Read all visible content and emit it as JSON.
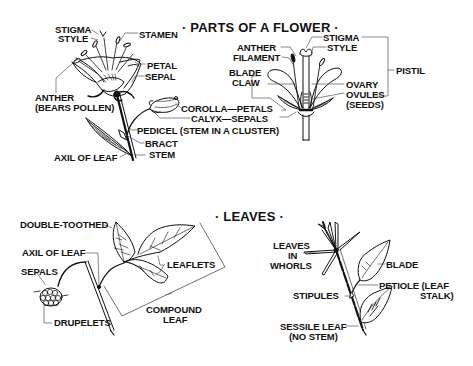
{
  "flower_section": {
    "title": "· PARTS OF A FLOWER ·",
    "left_flower_labels": {
      "stigma": "STIGMA",
      "style": "STYLE",
      "stamen": "STAMEN",
      "petal": "PETAL",
      "sepal": "SEPAL",
      "anther_line1": "ANTHER",
      "anther_line2": "(BEARS POLLEN)",
      "corolla": "COROLLA—PETALS",
      "calyx": "CALYX—SEPALS",
      "pedicel": "PEDICEL (STEM IN A CLUSTER)",
      "bract": "BRACT",
      "axil": "AXIL OF LEAF",
      "stem": "STEM"
    },
    "right_flower_labels": {
      "anther": "ANTHER",
      "filament": "FILAMENT",
      "blade": "BLADE",
      "claw": "CLAW",
      "stigma": "STIGMA",
      "style": "STYLE",
      "pistil": "PISTIL",
      "ovary": "OVARY",
      "ovules_line1": "OVULES",
      "ovules_line2": "(SEEDS)"
    }
  },
  "leaves_section": {
    "title": "· LEAVES ·",
    "compound_labels": {
      "double_toothed": "DOUBLE-TOOTHED",
      "axil": "AXIL OF LEAF",
      "sepals": "SEPALS",
      "leaflets": "LEAFLETS",
      "drupelets": "DRUPELETS",
      "compound_line1": "COMPOUND",
      "compound_line2": "LEAF"
    },
    "simple_labels": {
      "whorls_line1": "LEAVES",
      "whorls_line2": "IN",
      "whorls_line3": "WHORLS",
      "blade": "BLADE",
      "stipules": "STIPULES",
      "petiole_line1": "PETIOLE (LEAF",
      "petiole_line2": "STALK)",
      "sessile_line1": "SESSILE LEAF",
      "sessile_line2": "(NO STEM)"
    }
  },
  "colors": {
    "ink": "#111111",
    "background": "#ffffff",
    "leader": "#555555"
  }
}
